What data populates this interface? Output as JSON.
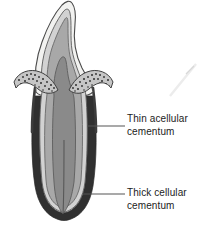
{
  "figure": {
    "background_color": "#ffffff"
  },
  "labels": [
    {
      "id": "thin-acellular-cementum",
      "text": "Thin acellular\ncementum",
      "line1": "Thin acellular",
      "line2": "cementum",
      "text_color": "#1c1c1c",
      "leader_line": {
        "x1": 87,
        "y1": 126,
        "x2": 125,
        "y2": 126,
        "color": "#555555"
      }
    },
    {
      "id": "thick-cellular-cementum",
      "text": "Thick cellular\ncementum",
      "line1": "Thick cellular",
      "line2": "cementum",
      "text_color": "#1c1c1c",
      "leader_line": {
        "x1": 83,
        "y1": 194,
        "x2": 125,
        "y2": 194,
        "color": "#555555"
      }
    }
  ],
  "anatomy": {
    "enamel": {
      "name": "enamel",
      "color": "#f2f2f0",
      "outline": "#4a4a4a"
    },
    "dentin_outer": {
      "name": "dentin-outer",
      "color": "#d2d2d2",
      "outline": "#5a5a5a"
    },
    "dentin_inner": {
      "name": "dentin-inner",
      "color": "#a8a8a8",
      "outline": "#6a6a6a"
    },
    "pulp": {
      "name": "pulp-chamber",
      "color": "#8a8a8a",
      "outline": "#5e5e5e"
    },
    "thin_cementum": {
      "name": "thin-acellular-cementum-band",
      "color": "#3c3c3c"
    },
    "thick_cementum": {
      "name": "thick-cellular-cementum-band",
      "color": "#303030"
    },
    "gingiva_left": {
      "name": "gingiva-left",
      "color": "#c6c6c6",
      "outline": "#4a4a4a",
      "stipple_color": "#2e2e2e"
    },
    "gingiva_right": {
      "name": "gingiva-right",
      "color": "#c6c6c6",
      "outline": "#4a4a4a",
      "stipple_color": "#2e2e2e"
    },
    "scan_artifact": {
      "name": "scan-artifact-streak",
      "color": "#e8e8e8"
    }
  }
}
